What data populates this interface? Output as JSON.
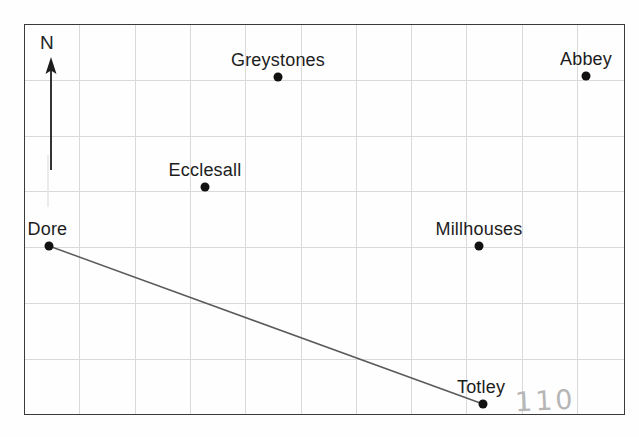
{
  "figure": {
    "kind": "scatter-map",
    "title": "",
    "frame": {
      "x": 24,
      "y": 24,
      "width": 601,
      "height": 391,
      "border_color": "#3a3a3a"
    },
    "background_color": "#ffffff",
    "grid_color": "#d9d9da"
  },
  "compass": {
    "label": "N",
    "icon": "north-arrow-icon",
    "direction": "up"
  },
  "annotations": [
    {
      "name": "pencil-number",
      "text": "110",
      "x": 515,
      "y": 385,
      "color": "#b6b6b6"
    }
  ],
  "chart_data": {
    "type": "scatter",
    "title": "",
    "xlabel": "",
    "ylabel": "",
    "grid": true,
    "legend": "none",
    "xlim": [
      0,
      11
    ],
    "ylim": [
      0,
      7
    ],
    "grid_spacing": {
      "x": 55.3,
      "y": 55.8
    },
    "points": [
      {
        "label": "Greystones",
        "px": 278,
        "py": 77,
        "grid_x": 4.59,
        "grid_y": 6.05,
        "label_position": "above"
      },
      {
        "label": "Abbey",
        "px": 586,
        "py": 76,
        "grid_x": 10.16,
        "grid_y": 6.07,
        "label_position": "above"
      },
      {
        "label": "Ecclesall",
        "px": 205,
        "py": 187,
        "grid_x": 3.27,
        "grid_y": 4.09,
        "label_position": "above"
      },
      {
        "label": "Millhouses",
        "px": 479,
        "py": 246,
        "grid_x": 8.23,
        "grid_y": 3.03,
        "label_position": "above"
      },
      {
        "label": "Dore",
        "px": 49,
        "py": 246,
        "grid_x": 0.45,
        "grid_y": 3.03,
        "label_position": "above-right"
      },
      {
        "label": "Totley",
        "px": 483,
        "py": 404,
        "grid_x": 8.3,
        "grid_y": 0.2,
        "label_position": "above-right"
      }
    ],
    "lines": [
      {
        "name": "dore-totley-bearing-line",
        "from": "Dore",
        "to": "Totley",
        "color": "#5a5a5a",
        "x1": 49,
        "y1": 246,
        "x2": 483,
        "y2": 404
      }
    ]
  }
}
